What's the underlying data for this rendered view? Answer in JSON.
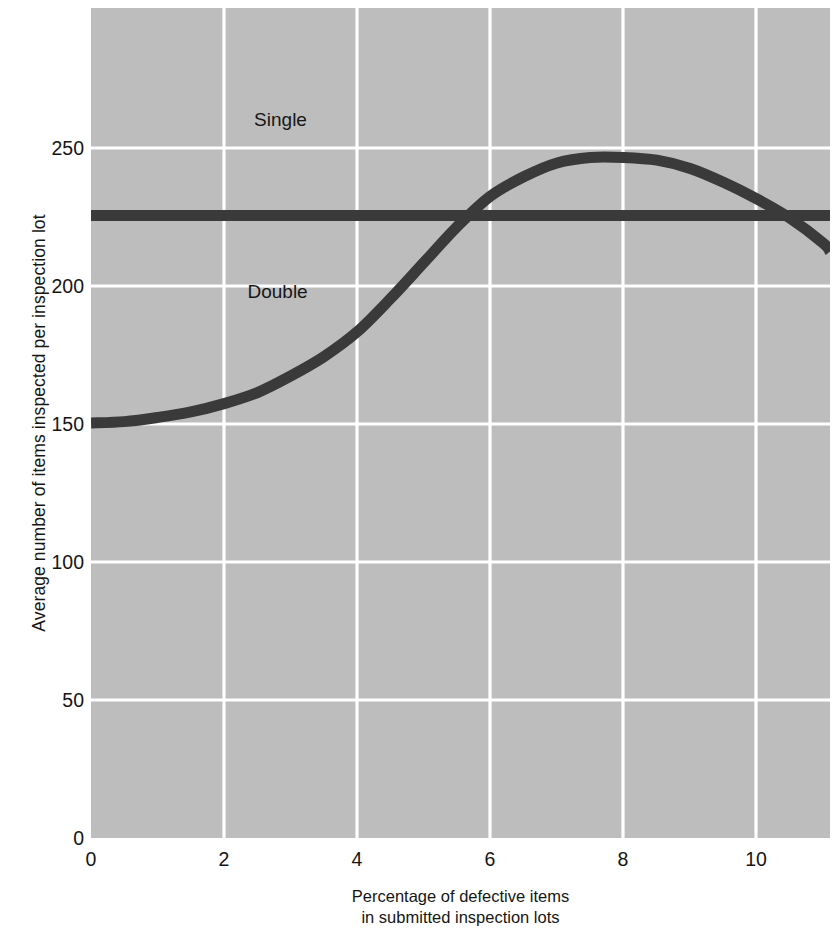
{
  "figure": {
    "background_color": "#ffffff",
    "plot_background_color": "#bdbdbd",
    "gridline_color": "#ffffff",
    "series_color": "#3a3a3a"
  },
  "axes": {
    "y_title": "Average number of items inspected per inspection lot",
    "x_caption_line1": "Percentage of defective items",
    "x_caption_line2": "in submitted inspection lots",
    "y_ticks": [
      "0",
      "50",
      "100",
      "150",
      "200",
      "250"
    ],
    "x_ticks": [
      "0",
      "2",
      "4",
      "6",
      "8",
      "10"
    ]
  },
  "labels": {
    "single": "Single",
    "double": "Double"
  },
  "chart_data": {
    "type": "line",
    "title": "",
    "xlabel": "Percentage of defective items in submitted inspection lots",
    "ylabel": "Average number of items inspected per inspection lot",
    "xlim": [
      0,
      11.1
    ],
    "ylim": [
      0,
      300
    ],
    "xticks": [
      0,
      2,
      4,
      6,
      8,
      10
    ],
    "yticks": [
      0,
      50,
      100,
      150,
      200,
      250
    ],
    "grid": true,
    "legend": "inline-annotations",
    "series": [
      {
        "name": "Single",
        "label_position": {
          "x": 2.45,
          "y": 263
        },
        "x": [
          0,
          11.1
        ],
        "values": [
          225,
          225
        ]
      },
      {
        "name": "Double",
        "label_position": {
          "x": 2.35,
          "y": 201
        },
        "x": [
          0,
          0.5,
          1,
          1.5,
          2,
          2.5,
          3,
          3.5,
          4,
          4.5,
          5,
          5.5,
          6,
          6.5,
          7,
          7.5,
          8,
          8.5,
          9,
          9.5,
          10,
          10.5,
          11,
          11.1
        ],
        "values": [
          150,
          150.5,
          152,
          154,
          157,
          161,
          167,
          174,
          183,
          195,
          208,
          221,
          232,
          239,
          244,
          246,
          246,
          245,
          242,
          237,
          231,
          224,
          215,
          212
        ]
      }
    ],
    "annotations": [
      {
        "text": "Single",
        "x": 2.45,
        "y": 263
      },
      {
        "text": "Double",
        "x": 2.35,
        "y": 201
      }
    ]
  }
}
